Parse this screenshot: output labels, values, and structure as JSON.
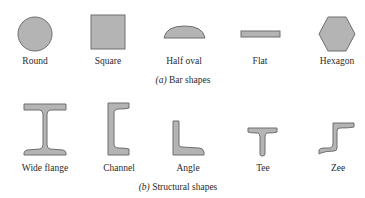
{
  "figure": {
    "fill_color": "#b4b4b4",
    "stroke_color": "#6e6e6e",
    "panel_a": {
      "caption_letter": "(a)",
      "caption_text": " Bar shapes",
      "shapes": [
        {
          "label": "Round",
          "icon": "circle-shape-icon"
        },
        {
          "label": "Square",
          "icon": "square-shape-icon"
        },
        {
          "label": "Half oval",
          "icon": "half-oval-shape-icon"
        },
        {
          "label": "Flat",
          "icon": "flat-bar-shape-icon"
        },
        {
          "label": "Hexagon",
          "icon": "hexagon-shape-icon"
        }
      ]
    },
    "panel_b": {
      "caption_letter": "(b)",
      "caption_text": " Structural shapes",
      "shapes": [
        {
          "label": "Wide flange",
          "icon": "wide-flange-beam-icon"
        },
        {
          "label": "Channel",
          "icon": "channel-section-icon"
        },
        {
          "label": "Angle",
          "icon": "angle-section-icon"
        },
        {
          "label": "Tee",
          "icon": "tee-section-icon"
        },
        {
          "label": "Zee",
          "icon": "zee-section-icon"
        }
      ]
    }
  }
}
